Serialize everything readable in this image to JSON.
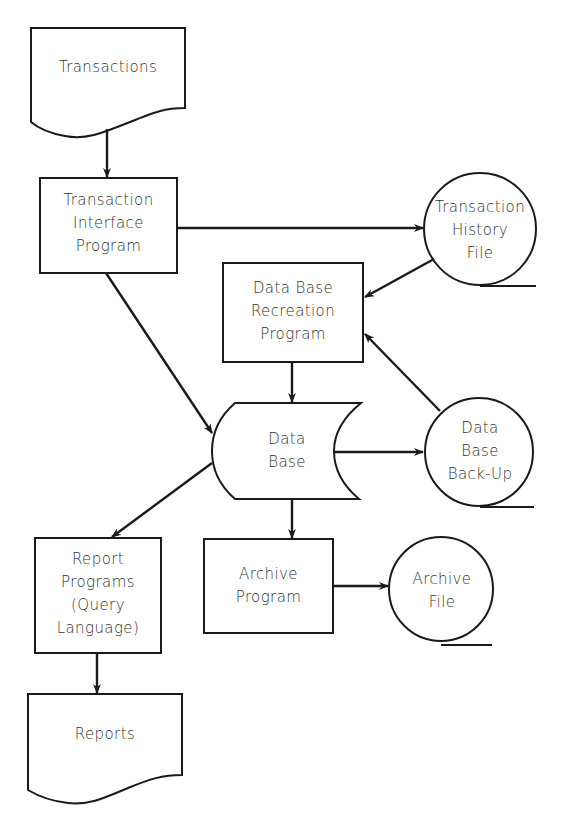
{
  "diagram": {
    "type": "system-flowchart",
    "colors": {
      "stroke": "#1a1a1a",
      "text": "#333333",
      "background": "#ffffff"
    },
    "nodes": {
      "transactions": {
        "shape": "document",
        "label": "Transactions"
      },
      "transaction_interface_program": {
        "shape": "process",
        "label": "Transaction\nInterface\nProgram"
      },
      "transaction_history_file": {
        "shape": "magnetic-tape",
        "label": "Transaction\nHistory\nFile"
      },
      "data_base_recreation_program": {
        "shape": "process",
        "label": "Data Base\nRecreation\nProgram"
      },
      "data_base": {
        "shape": "online-storage",
        "label": "Data\nBase"
      },
      "data_base_back_up": {
        "shape": "magnetic-tape",
        "label": "Data\nBase\nBack-Up"
      },
      "report_programs": {
        "shape": "process",
        "label": "Report\nPrograms\n(Query\nLanguage)"
      },
      "archive_program": {
        "shape": "process",
        "label": "Archive\nProgram"
      },
      "archive_file": {
        "shape": "magnetic-tape",
        "label": "Archive\nFile"
      },
      "reports": {
        "shape": "document",
        "label": "Reports"
      }
    },
    "edges": [
      {
        "from": "Transactions",
        "to": "Transaction Interface Program"
      },
      {
        "from": "Transaction Interface Program",
        "to": "Transaction History File"
      },
      {
        "from": "Transaction Interface Program",
        "to": "Data Base"
      },
      {
        "from": "Transaction History File",
        "to": "Data Base Recreation Program"
      },
      {
        "from": "Data Base Back-Up",
        "to": "Data Base Recreation Program"
      },
      {
        "from": "Data Base Recreation Program",
        "to": "Data Base"
      },
      {
        "from": "Data Base",
        "to": "Data Base Back-Up"
      },
      {
        "from": "Data Base",
        "to": "Report Programs (Query Language)"
      },
      {
        "from": "Data Base",
        "to": "Archive Program"
      },
      {
        "from": "Archive Program",
        "to": "Archive File"
      },
      {
        "from": "Report Programs (Query Language)",
        "to": "Reports"
      }
    ]
  }
}
